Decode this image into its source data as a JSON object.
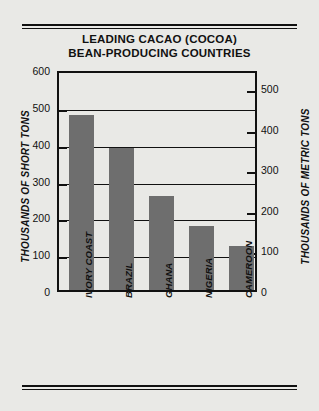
{
  "chart_data": {
    "type": "bar",
    "title": "LEADING CACAO (COCOA) BEAN-PRODUCING COUNTRIES",
    "title_line1": "LEADING CACAO (COCOA)",
    "title_line2": "BEAN-PRODUCING COUNTRIES",
    "categories": [
      "IVORY COAST",
      "BRAZIL",
      "GHANA",
      "NIGERIA",
      "CAMEROON"
    ],
    "values": [
      475,
      385,
      255,
      175,
      120
    ],
    "xlabel": "",
    "ylabel": "THOUSANDS OF SHORT TONS",
    "ylabel_right": "THOUSANDS OF METRIC TONS",
    "ylim": [
      0,
      600
    ],
    "yticks": [
      0,
      100,
      200,
      300,
      400,
      500,
      600
    ],
    "ylim_right": [
      0,
      545
    ],
    "yticks_right": [
      0,
      100,
      200,
      300,
      400,
      500
    ],
    "grid": true,
    "legend": "none",
    "bar_color": "#6e6e6e",
    "background_color": "#e9e9e6",
    "axis_color": "#111111"
  },
  "ticks_left": [
    {
      "label": "600",
      "value": 600
    },
    {
      "label": "500",
      "value": 500
    },
    {
      "label": "400",
      "value": 400
    },
    {
      "label": "300",
      "value": 300
    },
    {
      "label": "200",
      "value": 200
    },
    {
      "label": "100",
      "value": 100
    },
    {
      "label": "0",
      "value": 0
    }
  ],
  "ticks_right": [
    {
      "label": "500",
      "value": 500
    },
    {
      "label": "400",
      "value": 400
    },
    {
      "label": "300",
      "value": 300
    },
    {
      "label": "200",
      "value": 200
    },
    {
      "label": "100",
      "value": 100
    },
    {
      "label": "0",
      "value": 0
    }
  ],
  "bars": [
    {
      "label": "IVORY COAST",
      "value": 475
    },
    {
      "label": "BRAZIL",
      "value": 385
    },
    {
      "label": "GHANA",
      "value": 255
    },
    {
      "label": "NIGERIA",
      "value": 175
    },
    {
      "label": "CAMEROON",
      "value": 120
    }
  ]
}
